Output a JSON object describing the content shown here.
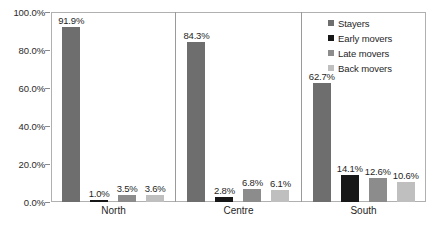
{
  "chart_data": {
    "type": "bar",
    "title": "",
    "subtitle": "",
    "xlabel": "",
    "ylabel": "",
    "categories": [
      "North",
      "Centre",
      "South"
    ],
    "series": [
      {
        "name": "Stayers",
        "color": "#6e6e6e",
        "values": [
          91.9,
          84.3,
          62.7
        ]
      },
      {
        "name": "Early movers",
        "color": "#171717",
        "values": [
          1.0,
          2.8,
          14.1
        ]
      },
      {
        "name": "Late movers",
        "color": "#8c8c8c",
        "values": [
          3.5,
          6.8,
          12.6
        ]
      },
      {
        "name": "Back movers",
        "color": "#bfbfbf",
        "values": [
          3.6,
          6.1,
          10.6
        ]
      }
    ],
    "value_labels": [
      [
        "91.9%",
        "1.0%",
        "3.5%",
        "3.6%"
      ],
      [
        "84.3%",
        "2.8%",
        "6.8%",
        "6.1%"
      ],
      [
        "62.7%",
        "14.1%",
        "12.6%",
        "10.6%"
      ]
    ],
    "ylim": [
      0,
      100
    ],
    "y_ticks": [
      0,
      20,
      40,
      60,
      80,
      100
    ],
    "y_tick_labels": [
      "0.0%",
      "20.0%",
      "40.0%",
      "60.0%",
      "80.0%",
      "100.0%"
    ],
    "grid": false,
    "legend_position": "top-right",
    "group_separators": true
  },
  "axis": {
    "frame_color": "#b0b0b0",
    "separator_color": "#9a9a9a"
  },
  "legend": {
    "entries": [
      {
        "label": "Stayers",
        "color": "#6e6e6e"
      },
      {
        "label": "Early movers",
        "color": "#171717"
      },
      {
        "label": "Late movers",
        "color": "#8c8c8c"
      },
      {
        "label": "Back movers",
        "color": "#bfbfbf"
      }
    ]
  }
}
